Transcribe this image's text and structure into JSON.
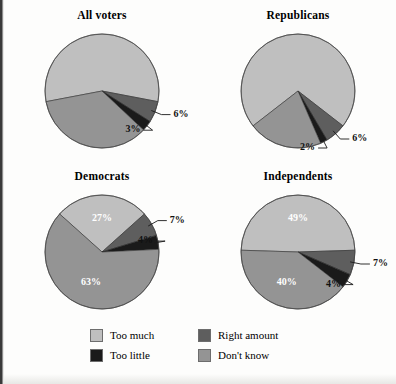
{
  "figure": {
    "background_color": "#fdfdfc",
    "text_color": "#000000"
  },
  "legend": {
    "items": [
      {
        "label": "Too much",
        "color": "#bfbfbf",
        "order": 0
      },
      {
        "label": "Right amount",
        "color": "#5e5e5e",
        "order": 1
      },
      {
        "label": "Too little",
        "color": "#1a1a1a",
        "order": 2
      },
      {
        "label": "Don't know",
        "color": "#949494",
        "order": 3
      }
    ]
  },
  "chart_data": {
    "type": "pie",
    "title": "",
    "legend_position": "bottom",
    "categories": [
      "Too much",
      "Right amount",
      "Too little",
      "Don't know"
    ],
    "colors": [
      "#bfbfbf",
      "#5e5e5e",
      "#1a1a1a",
      "#949494"
    ],
    "charts": [
      {
        "title": "All voters",
        "values": [
          56,
          6,
          3,
          35
        ],
        "labels": [
          "",
          "6%",
          "3%",
          ""
        ],
        "label_placement": [
          "none",
          "outside-right",
          "outside-left",
          "none"
        ]
      },
      {
        "title": "Republicans",
        "values": [
          71,
          6,
          2,
          21
        ],
        "labels": [
          "",
          "6%",
          "2%",
          ""
        ],
        "label_placement": [
          "none",
          "outside-right",
          "outside-left",
          "none"
        ]
      },
      {
        "title": "Democrats",
        "values": [
          27,
          7,
          4,
          63
        ],
        "labels": [
          "27%",
          "7%",
          "4%",
          "63%"
        ],
        "label_placement": [
          "inside",
          "outside-right",
          "outside-left",
          "inside"
        ]
      },
      {
        "title": "Independents",
        "values": [
          49,
          7,
          4,
          40
        ],
        "labels": [
          "49%",
          "7%",
          "4%",
          "40%"
        ],
        "label_placement": [
          "inside",
          "outside-right",
          "outside-left",
          "inside"
        ]
      }
    ]
  }
}
